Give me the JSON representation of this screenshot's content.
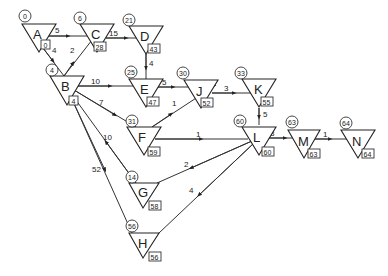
{
  "diagram": {
    "type": "activity-network",
    "nodes": [
      {
        "id": "A",
        "early": "0",
        "late": "0"
      },
      {
        "id": "B",
        "early": "4",
        "late": "4"
      },
      {
        "id": "C",
        "early": "6",
        "late": "28"
      },
      {
        "id": "D",
        "early": "21",
        "late": "43"
      },
      {
        "id": "E",
        "early": "25",
        "late": "47"
      },
      {
        "id": "F",
        "early": "31",
        "late": "59"
      },
      {
        "id": "G",
        "early": "14",
        "late": "58"
      },
      {
        "id": "H",
        "early": "56",
        "late": "56"
      },
      {
        "id": "J",
        "early": "30",
        "late": "52"
      },
      {
        "id": "K",
        "early": "33",
        "late": "55"
      },
      {
        "id": "L",
        "early": "60",
        "late": "60"
      },
      {
        "id": "M",
        "early": "63",
        "late": "63"
      },
      {
        "id": "N",
        "early": "64",
        "late": "64"
      }
    ],
    "edges": [
      {
        "from": "A",
        "to": "C",
        "weight": "5"
      },
      {
        "from": "A",
        "to": "B",
        "weight": "4"
      },
      {
        "from": "B",
        "to": "C",
        "weight": "2"
      },
      {
        "from": "C",
        "to": "D",
        "weight": "15"
      },
      {
        "from": "D",
        "to": "E",
        "weight": "4"
      },
      {
        "from": "B",
        "to": "E",
        "weight": "10"
      },
      {
        "from": "E",
        "to": "J",
        "weight": "5"
      },
      {
        "from": "B",
        "to": "F",
        "weight": "7"
      },
      {
        "from": "F",
        "to": "J",
        "weight": "1"
      },
      {
        "from": "J",
        "to": "K",
        "weight": "3"
      },
      {
        "from": "K",
        "to": "L",
        "weight": "5"
      },
      {
        "from": "F",
        "to": "L",
        "weight": "1"
      },
      {
        "from": "B",
        "to": "G",
        "weight": "10"
      },
      {
        "from": "G",
        "to": "L",
        "weight": "2"
      },
      {
        "from": "B",
        "to": "H",
        "weight": "52"
      },
      {
        "from": "H",
        "to": "L",
        "weight": "4"
      },
      {
        "from": "L",
        "to": "M",
        "weight": "3"
      },
      {
        "from": "M",
        "to": "N",
        "weight": "1"
      }
    ]
  }
}
